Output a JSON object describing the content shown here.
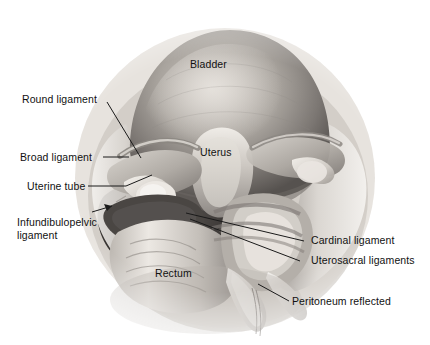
{
  "figure": {
    "kind": "anatomical-illustration",
    "style": "grayscale airbrush medical illustration on white background",
    "palette": {
      "background": "#ffffff",
      "label_text": "#111111",
      "leader_line": "#1a1a1a",
      "tissue_light": "#f2efea",
      "tissue_mid": "#b9b4ae",
      "tissue_dark": "#6f6a66",
      "tissue_shadow": "#3d3a38"
    }
  },
  "labels": [
    {
      "id": "bladder",
      "text": "Bladder",
      "leader": false
    },
    {
      "id": "round-ligament",
      "text": "Round ligament",
      "leader": true
    },
    {
      "id": "broad-ligament",
      "text": "Broad ligament",
      "leader": true
    },
    {
      "id": "uterine-tube",
      "text": "Uterine tube",
      "leader": true
    },
    {
      "id": "infundibulopelvic",
      "text": "Infundibulopelvic\nligament",
      "leader": true
    },
    {
      "id": "uterus",
      "text": "Uterus",
      "leader": false
    },
    {
      "id": "rectum",
      "text": "Rectum",
      "leader": false
    },
    {
      "id": "cardinal-ligament",
      "text": "Cardinal ligament",
      "leader": true
    },
    {
      "id": "uterosacral",
      "text": "Uterosacral ligaments",
      "leader": true
    },
    {
      "id": "peritoneum",
      "text": "Peritoneum reflected",
      "leader": true
    }
  ]
}
